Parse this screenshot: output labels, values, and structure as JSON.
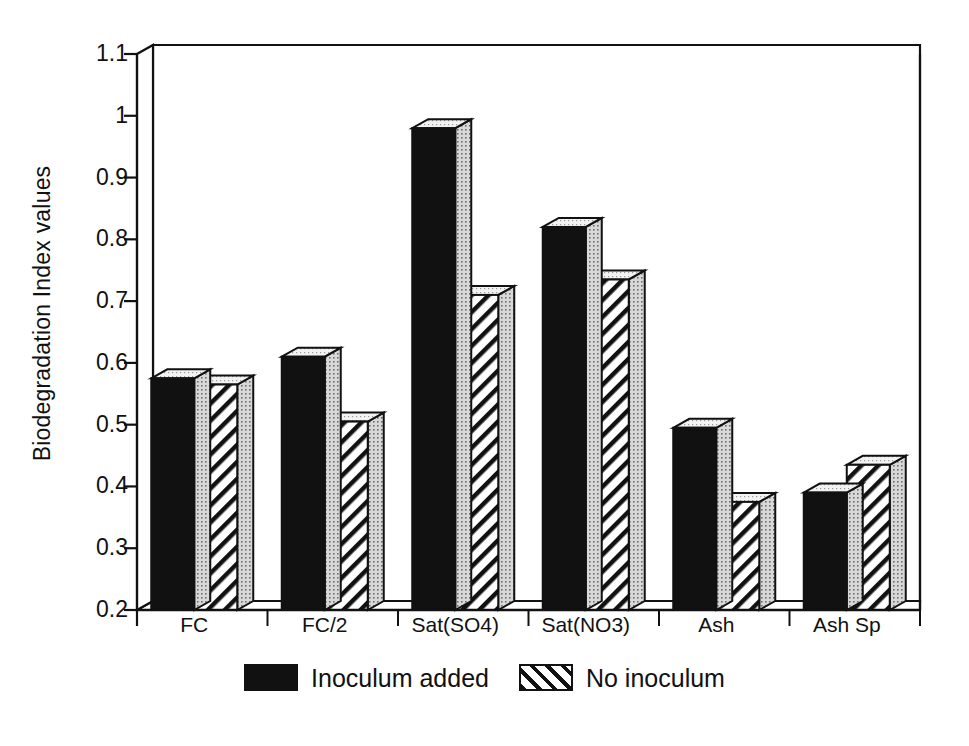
{
  "chart_data": {
    "type": "bar",
    "title": "",
    "subtitle": "",
    "xlabel": "",
    "ylabel": "Biodegradation Index values",
    "ylim": [
      0.2,
      1.1
    ],
    "ytick_labels": [
      "1.1",
      "1",
      "0.9",
      "0.8",
      "0.7",
      "0.6",
      "0.5",
      "0.4",
      "0.3",
      "0.2"
    ],
    "ytick_values": [
      1.1,
      1.0,
      0.9,
      0.8,
      0.7,
      0.6,
      0.5,
      0.4,
      0.3,
      0.2
    ],
    "grid": false,
    "legend_position": "bottom",
    "style": "3d-bars",
    "categories": [
      "FC",
      "FC/2",
      "Sat(SO4)",
      "Sat(NO3)",
      "Ash",
      "Ash Sp"
    ],
    "series": [
      {
        "name": "Inoculum added",
        "fill": "solid-black",
        "color": "#111111",
        "values": [
          0.575,
          0.61,
          0.98,
          0.82,
          0.495,
          0.39
        ]
      },
      {
        "name": "No inoculum",
        "fill": "diagonal-hatch",
        "color": "#ffffff",
        "values": [
          0.565,
          0.505,
          0.71,
          0.735,
          0.375,
          0.435
        ]
      }
    ]
  },
  "legend": {
    "entries": [
      {
        "label": "Inoculum added",
        "swatch": "solid-swatch"
      },
      {
        "label": "No inoculum",
        "swatch": "hatch-swatch"
      }
    ]
  },
  "colors": {
    "axis": "#111111",
    "bar_solid": "#111111",
    "bar_hatch_bg": "#ffffff",
    "bar_top_face": "#f2f2f2",
    "bar_side_face": "#d8d8d8",
    "background": "#ffffff"
  }
}
